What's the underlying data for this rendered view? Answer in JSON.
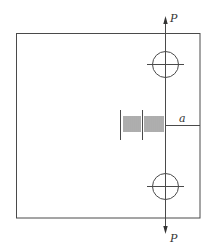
{
  "diagram": {
    "type": "plate-with-crack-under-tension",
    "colors": {
      "background": "#ffffff",
      "line": "#4a4a4a",
      "text": "#333333"
    },
    "labels": {
      "force_top": "P",
      "force_bottom": "P",
      "crack_length": "a"
    },
    "elements": {
      "plate": "rectangular specimen outline",
      "top_pin_hole": "circular hole with crosshair (upper loading point)",
      "bottom_pin_hole": "circular hole with crosshair (lower loading point)",
      "load_line": "vertical load line through both holes",
      "crack_scale": "graduated tick scale along crack",
      "crack_dimension": "dimension line for crack length a"
    }
  }
}
